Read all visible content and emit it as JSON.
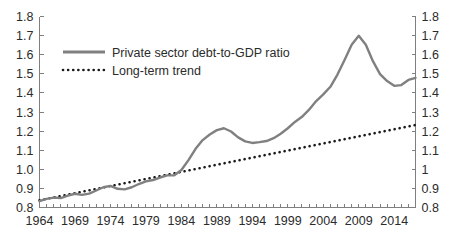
{
  "chart_data": {
    "type": "line",
    "title": "",
    "xlabel": "",
    "ylabel": "",
    "xlim": [
      1964,
      2017
    ],
    "ylim": [
      0.8,
      1.8
    ],
    "grid": false,
    "legend_position": "top-left-inside",
    "y_ticks_left": [
      "1.8",
      "1.7",
      "1.6",
      "1.5",
      "1.4",
      "1.3",
      "1.2",
      "1.1",
      "1.0",
      "0.9",
      "0.8"
    ],
    "y_ticks_right": [
      "1.8",
      "1.7",
      "1.6",
      "1.5",
      "1.4",
      "1.3",
      "1.2",
      "1.1",
      "1",
      "0.9",
      "0.8"
    ],
    "y_tick_values": [
      1.8,
      1.7,
      1.6,
      1.5,
      1.4,
      1.3,
      1.2,
      1.1,
      1.0,
      0.9,
      0.8
    ],
    "x_tick_labels": [
      "1964",
      "1969",
      "1974",
      "1979",
      "1984",
      "1989",
      "1994",
      "1999",
      "2004",
      "2009",
      "2014"
    ],
    "x_tick_values": [
      1964,
      1969,
      1974,
      1979,
      1984,
      1989,
      1994,
      1999,
      2004,
      2009,
      2014
    ],
    "x_minor_tick_step": 1,
    "series": [
      {
        "name": "Private sector debt-to-GDP ratio",
        "style": "solid",
        "color": "#808080",
        "width": 2.4,
        "x": [
          1964,
          1965,
          1966,
          1967,
          1968,
          1969,
          1970,
          1971,
          1972,
          1973,
          1974,
          1975,
          1976,
          1977,
          1978,
          1979,
          1980,
          1981,
          1982,
          1983,
          1984,
          1985,
          1986,
          1987,
          1988,
          1989,
          1990,
          1991,
          1992,
          1993,
          1994,
          1995,
          1996,
          1997,
          1998,
          1999,
          2000,
          2001,
          2002,
          2003,
          2004,
          2005,
          2006,
          2007,
          2008,
          2009,
          2010,
          2011,
          2012,
          2013,
          2014,
          2015,
          2016,
          2017
        ],
        "values": [
          0.833,
          0.845,
          0.852,
          0.849,
          0.862,
          0.872,
          0.866,
          0.873,
          0.889,
          0.906,
          0.913,
          0.898,
          0.895,
          0.906,
          0.923,
          0.937,
          0.944,
          0.957,
          0.968,
          0.969,
          0.996,
          1.048,
          1.107,
          1.153,
          1.182,
          1.205,
          1.215,
          1.198,
          1.167,
          1.146,
          1.138,
          1.142,
          1.148,
          1.163,
          1.186,
          1.215,
          1.248,
          1.275,
          1.312,
          1.357,
          1.392,
          1.432,
          1.496,
          1.572,
          1.652,
          1.699,
          1.652,
          1.566,
          1.498,
          1.462,
          1.437,
          1.441,
          1.468,
          1.479
        ]
      },
      {
        "name": "Long-term trend",
        "style": "dotted",
        "color": "#1a1a1a",
        "width": 2.6,
        "x": [
          1964,
          2017
        ],
        "values": [
          0.838,
          1.232
        ]
      }
    ],
    "legend": [
      {
        "label": "Private sector debt-to-GDP ratio",
        "style": "solid",
        "color": "#808080"
      },
      {
        "label": "Long-term trend",
        "style": "dotted",
        "color": "#1a1a1a"
      }
    ]
  }
}
